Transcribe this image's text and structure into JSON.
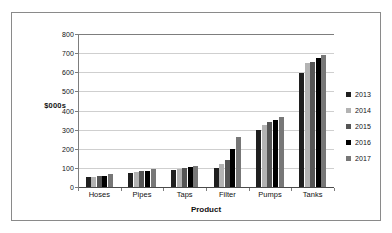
{
  "chart_data": {
    "type": "bar",
    "title": "",
    "xlabel": "Product",
    "ylabel": "$000s",
    "ylim": [
      0,
      800
    ],
    "yticks": [
      0,
      100,
      200,
      300,
      400,
      500,
      600,
      700,
      800
    ],
    "grid": true,
    "legend_position": "right",
    "categories": [
      "Hoses",
      "Pipes",
      "Taps",
      "Filter",
      "Pumps",
      "Tanks"
    ],
    "series": [
      {
        "name": "2013",
        "color": "#1f1f1f",
        "values": [
          50,
          74,
          88,
          98,
          298,
          595
        ]
      },
      {
        "name": "2014",
        "color": "#b3b3b3",
        "values": [
          50,
          79,
          96,
          120,
          326,
          648
        ]
      },
      {
        "name": "2015",
        "color": "#555555",
        "values": [
          56,
          84,
          100,
          140,
          338,
          654
        ]
      },
      {
        "name": "2016",
        "color": "#000000",
        "values": [
          60,
          86,
          104,
          198,
          348,
          672
        ]
      },
      {
        "name": "2017",
        "color": "#777777",
        "values": [
          68,
          94,
          110,
          260,
          368,
          690
        ]
      }
    ]
  },
  "legend": {
    "items": [
      {
        "label": "2013"
      },
      {
        "label": "2014"
      },
      {
        "label": "2015"
      },
      {
        "label": "2016"
      },
      {
        "label": "2017"
      }
    ]
  }
}
